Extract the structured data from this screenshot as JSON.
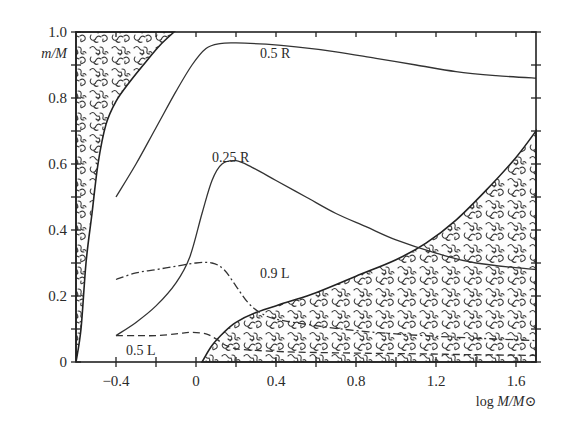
{
  "chart_data": {
    "type": "line",
    "title": "",
    "xlabel": "log M/M⊙",
    "ylabel": "m/M",
    "xlim": [
      -0.6,
      1.7
    ],
    "ylim": [
      0,
      1.0
    ],
    "grid": false,
    "legend": "inline curve labels",
    "x_ticks": [
      -0.4,
      -0.2,
      0,
      0.2,
      0.4,
      0.6,
      0.8,
      1.0,
      1.2,
      1.4,
      1.6
    ],
    "x_tick_labels": [
      {
        "value": -0.4,
        "label": "−0.4"
      },
      {
        "value": 0,
        "label": "0"
      },
      {
        "value": 0.4,
        "label": "0.4"
      },
      {
        "value": 0.8,
        "label": "0.8"
      },
      {
        "value": 1.2,
        "label": "1.2"
      },
      {
        "value": 1.6,
        "label": "1.6"
      }
    ],
    "y_ticks": [
      0,
      0.1,
      0.2,
      0.3,
      0.4,
      0.5,
      0.6,
      0.7,
      0.8,
      0.9,
      1.0
    ],
    "y_tick_labels": [
      {
        "value": 0,
        "label": "0"
      },
      {
        "value": 0.2,
        "label": "0.2"
      },
      {
        "value": 0.4,
        "label": "0.4"
      },
      {
        "value": 0.6,
        "label": "0.6"
      },
      {
        "value": 0.8,
        "label": "0.8"
      },
      {
        "value": 1.0,
        "label": "1.0"
      }
    ],
    "series": [
      {
        "name": "0.5 R",
        "style": "solid",
        "label_pos": [
          0.32,
          0.935
        ],
        "x": [
          -0.4,
          -0.3,
          -0.2,
          -0.1,
          -0.02,
          0.05,
          0.12,
          0.2,
          0.35,
          0.5,
          0.7,
          0.9,
          1.1,
          1.3,
          1.5,
          1.7
        ],
        "y": [
          0.5,
          0.6,
          0.71,
          0.82,
          0.9,
          0.95,
          0.965,
          0.967,
          0.963,
          0.955,
          0.94,
          0.92,
          0.9,
          0.88,
          0.868,
          0.86
        ]
      },
      {
        "name": "0.25 R",
        "style": "solid",
        "label_pos": [
          0.08,
          0.62
        ],
        "x": [
          -0.4,
          -0.3,
          -0.2,
          -0.1,
          -0.03,
          0.03,
          0.08,
          0.13,
          0.2,
          0.28,
          0.4,
          0.55,
          0.7,
          0.85,
          1.0,
          1.2,
          1.4,
          1.7
        ],
        "y": [
          0.08,
          0.12,
          0.17,
          0.24,
          0.32,
          0.45,
          0.55,
          0.6,
          0.61,
          0.59,
          0.55,
          0.5,
          0.45,
          0.41,
          0.37,
          0.33,
          0.3,
          0.28
        ]
      },
      {
        "name": "0.9 L",
        "style": "dashdot",
        "label_pos": [
          0.32,
          0.27
        ],
        "x": [
          -0.4,
          -0.3,
          -0.2,
          -0.1,
          0.0,
          0.08,
          0.14,
          0.2,
          0.26,
          0.32,
          0.4,
          0.6,
          0.8,
          1.0,
          1.3,
          1.7
        ],
        "y": [
          0.25,
          0.27,
          0.28,
          0.29,
          0.3,
          0.3,
          0.28,
          0.23,
          0.18,
          0.15,
          0.13,
          0.11,
          0.095,
          0.085,
          0.075,
          0.065
        ]
      },
      {
        "name": "0.5 L",
        "style": "dashed",
        "label_pos": [
          -0.35,
          0.035
        ],
        "x": [
          -0.4,
          -0.3,
          -0.2,
          -0.1,
          -0.02,
          0.05,
          0.1,
          0.15,
          0.2,
          0.3,
          0.5,
          0.8,
          1.1,
          1.4,
          1.7
        ],
        "y": [
          0.08,
          0.08,
          0.08,
          0.085,
          0.09,
          0.085,
          0.07,
          0.05,
          0.04,
          0.035,
          0.03,
          0.027,
          0.025,
          0.022,
          0.02
        ]
      }
    ],
    "shaded_regions": [
      {
        "name": "upper-left hatched region",
        "boundary_x": [
          -0.6,
          -0.575,
          -0.55,
          -0.52,
          -0.49,
          -0.45,
          -0.4,
          -0.33,
          -0.25,
          -0.18,
          -0.11
        ],
        "boundary_y": [
          0.0,
          0.1,
          0.3,
          0.45,
          0.6,
          0.72,
          0.79,
          0.85,
          0.91,
          0.96,
          1.0
        ]
      },
      {
        "name": "lower-right hatched region",
        "boundary_x": [
          0.03,
          0.08,
          0.14,
          0.2,
          0.3,
          0.45,
          0.6,
          0.8,
          1.0,
          1.15,
          1.3,
          1.45,
          1.6,
          1.7
        ],
        "boundary_y": [
          0.0,
          0.05,
          0.09,
          0.12,
          0.15,
          0.18,
          0.21,
          0.26,
          0.31,
          0.36,
          0.43,
          0.52,
          0.62,
          0.7
        ]
      }
    ]
  }
}
